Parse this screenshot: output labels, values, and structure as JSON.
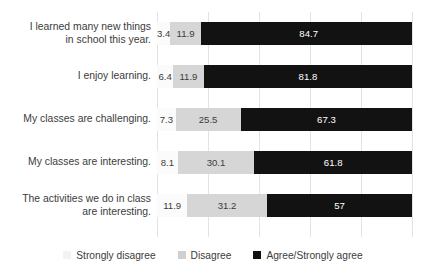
{
  "chart_data": {
    "type": "bar",
    "title": "",
    "subtitle": "",
    "xlabel": "",
    "ylabel": "",
    "orientation": "horizontal",
    "stacked": true,
    "stack_mode": "percent",
    "xlim": [
      0,
      100
    ],
    "grid": true,
    "gridline_values": [
      0,
      20,
      40,
      60,
      80,
      100
    ],
    "tick_labels": [],
    "legend_position": "bottom",
    "categories": [
      "I learned many new things\nin school this year.",
      "I enjoy learning.",
      "My classes are challenging.",
      "My classes are interesting.",
      "The activities we do in class\nare interesting."
    ],
    "series": [
      {
        "name": "Strongly disagree",
        "color": "#fbfbfb",
        "values": [
          3.4,
          6.4,
          7.3,
          8.1,
          11.9
        ],
        "labels": [
          "3.4",
          "6.4",
          "7.3",
          "8.1",
          "11.9"
        ]
      },
      {
        "name": "Disagree",
        "color": "#d6d6d6",
        "values": [
          11.9,
          11.9,
          25.5,
          30.1,
          31.2
        ],
        "labels": [
          "11.9",
          "11.9",
          "25.5",
          "30.1",
          "31.2"
        ]
      },
      {
        "name": "Agree/Strongly agree",
        "color": "#121212",
        "values": [
          84.7,
          81.8,
          67.3,
          61.8,
          57
        ],
        "labels": [
          "84.7",
          "81.8",
          "67.3",
          "61.8",
          "57"
        ]
      }
    ]
  },
  "legend": {
    "items": [
      {
        "label": "Strongly disagree",
        "swatch": "#f2f2f2"
      },
      {
        "label": "Disagree",
        "swatch": "#d0d0d0"
      },
      {
        "label": "Agree/Strongly agree",
        "swatch": "#121212"
      }
    ]
  }
}
